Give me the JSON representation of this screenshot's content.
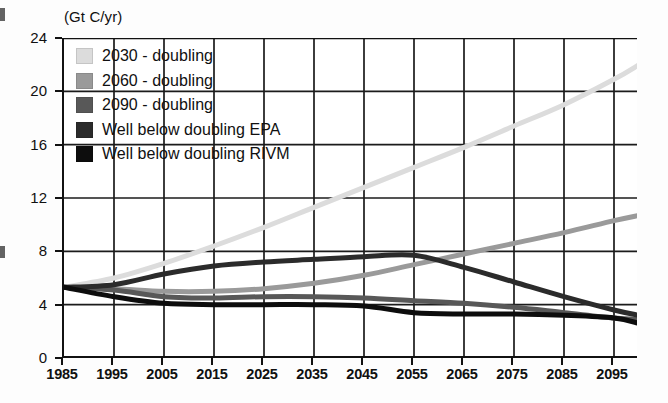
{
  "chart_data": {
    "type": "line",
    "title": "",
    "subtitle": "",
    "unit_label": "(Gt C/yr)",
    "xlabel": "",
    "ylabel": "",
    "ylim": [
      0,
      24
    ],
    "xlim": [
      1985,
      2100
    ],
    "yticks": [
      0,
      4,
      8,
      12,
      16,
      20,
      24
    ],
    "xticks": [
      1985,
      1995,
      2005,
      2015,
      2025,
      2035,
      2045,
      2055,
      2065,
      2075,
      2085,
      2095
    ],
    "grid": true,
    "legend_position": "upper-left-inside",
    "x": [
      1985,
      1995,
      2005,
      2015,
      2025,
      2035,
      2045,
      2055,
      2065,
      2075,
      2085,
      2095,
      2100
    ],
    "series": [
      {
        "name": "2030 - doubling",
        "color": "#dcdcdc",
        "values": [
          5.3,
          6.0,
          7.1,
          8.4,
          9.8,
          11.3,
          12.8,
          14.3,
          15.8,
          17.4,
          19.0,
          20.9,
          22.0
        ]
      },
      {
        "name": "2060 - doubling",
        "color": "#9a9a9a",
        "values": [
          5.3,
          5.2,
          5.0,
          5.0,
          5.2,
          5.6,
          6.2,
          7.0,
          7.8,
          8.6,
          9.4,
          10.3,
          10.7
        ]
      },
      {
        "name": "2090 - doubling",
        "color": "#585858",
        "values": [
          5.3,
          5.1,
          4.6,
          4.5,
          4.6,
          4.6,
          4.5,
          4.3,
          4.1,
          3.8,
          3.4,
          3.0,
          2.9
        ]
      },
      {
        "name": "Well below doubling EPA",
        "color": "#2b2b2b",
        "values": [
          5.3,
          5.5,
          6.3,
          6.9,
          7.2,
          7.4,
          7.6,
          7.7,
          6.8,
          5.7,
          4.6,
          3.6,
          3.2
        ]
      },
      {
        "name": "Well below doubling RIVM",
        "color": "#0d0d0d",
        "values": [
          5.3,
          4.6,
          4.1,
          4.0,
          4.0,
          4.0,
          3.9,
          3.4,
          3.3,
          3.3,
          3.2,
          3.0,
          2.6
        ]
      }
    ]
  },
  "legend": {
    "items": [
      {
        "label": "2030 - doubling",
        "color": "#dcdcdc"
      },
      {
        "label": "2060 - doubling",
        "color": "#9a9a9a"
      },
      {
        "label": "2090 - doubling",
        "color": "#585858"
      },
      {
        "label": "Well below doubling EPA",
        "color": "#2b2b2b"
      },
      {
        "label": "Well below doubling RIVM",
        "color": "#0d0d0d"
      }
    ]
  }
}
